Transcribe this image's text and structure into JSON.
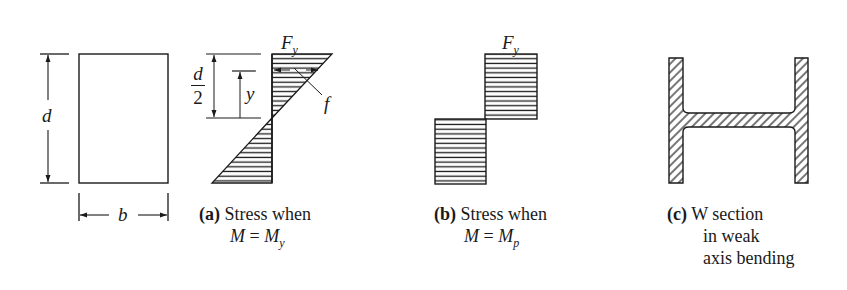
{
  "colors": {
    "ink": "#1a1a1a",
    "background": "#ffffff"
  },
  "cross_section": {
    "depth_label": "d",
    "width_label": "b"
  },
  "diagram_a": {
    "top_label": "F",
    "top_label_sub": "y",
    "half_depth_num": "d",
    "half_depth_den": "2",
    "distance_label": "y",
    "stress_label": "f",
    "caption_tag": "(a)",
    "caption_line1": "Stress when",
    "caption_line2_lhs": "M",
    "caption_line2_eq": "=",
    "caption_line2_rhs": "M",
    "caption_line2_sub": "y"
  },
  "diagram_b": {
    "top_label": "F",
    "top_label_sub": "y",
    "caption_tag": "(b)",
    "caption_line1": "Stress when",
    "caption_line2_lhs": "M",
    "caption_line2_eq": "=",
    "caption_line2_rhs": "M",
    "caption_line2_sub": "p"
  },
  "diagram_c": {
    "caption_tag": "(c)",
    "caption_line1": "W section",
    "caption_line2": "in weak",
    "caption_line3": "axis bending"
  }
}
